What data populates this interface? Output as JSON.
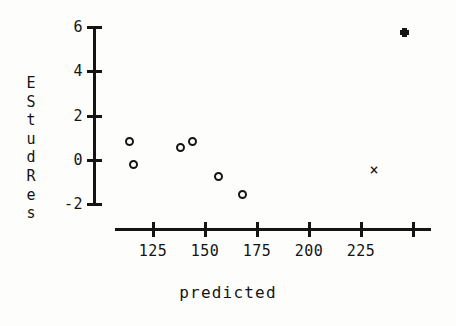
{
  "chart_data": {
    "type": "scatter",
    "title": "",
    "xlabel": "predicted",
    "ylabel": "EStudRes",
    "ylabel_chars": [
      "E",
      "S",
      "t",
      "u",
      "d",
      "R",
      "e",
      "s"
    ],
    "xlim": [
      111,
      255
    ],
    "ylim": [
      -2.6,
      6.3
    ],
    "xticks": [
      125,
      150,
      175,
      200,
      225,
      250
    ],
    "xtick_labels": [
      "125",
      "150",
      "175",
      "200",
      "225",
      ""
    ],
    "yticks": [
      -2,
      0,
      2,
      4,
      6
    ],
    "ytick_labels": [
      "-2",
      "0",
      "2",
      "4",
      "6"
    ],
    "grid": false,
    "legend": null,
    "series": [
      {
        "name": "residuals",
        "marker": "open-circle",
        "points": [
          {
            "x": 114.4,
            "y": 0.77
          },
          {
            "x": 115.9,
            "y": -0.27
          },
          {
            "x": 138.9,
            "y": 0.54
          },
          {
            "x": 144.7,
            "y": 0.77
          },
          {
            "x": 157.2,
            "y": -0.81
          },
          {
            "x": 168.7,
            "y": -1.62
          }
        ]
      },
      {
        "name": "flagged-x",
        "marker": "x-cross",
        "points": [
          {
            "x": 231.7,
            "y": -0.54
          }
        ]
      },
      {
        "name": "flagged-dot",
        "marker": "filled-dot",
        "points": [
          {
            "x": 246.6,
            "y": 5.72
          }
        ]
      }
    ]
  },
  "axes": {
    "y_axis_name": "y-axis",
    "x_axis_name": "x-axis"
  }
}
